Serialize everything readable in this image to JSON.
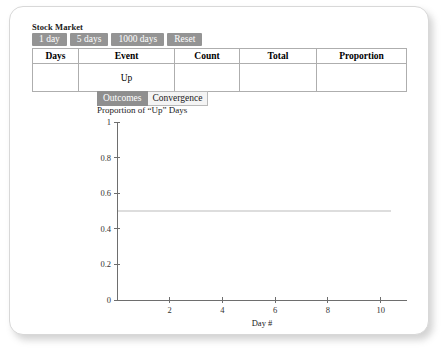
{
  "app": {
    "title": "Stock Market"
  },
  "toolbar": {
    "buttons": [
      {
        "label": "1 day",
        "name": "one-day-button"
      },
      {
        "label": "5 days",
        "name": "five-days-button"
      },
      {
        "label": "1000 days",
        "name": "thousand-days-button"
      },
      {
        "label": "Reset",
        "name": "reset-button"
      }
    ]
  },
  "table": {
    "headers": [
      "Days",
      "Event",
      "Count",
      "Total",
      "Proportion"
    ],
    "rows": [
      {
        "days": "",
        "event": "Up",
        "count": "",
        "total": "",
        "proportion": ""
      }
    ]
  },
  "tabs": [
    {
      "label": "Outcomes",
      "selected": true
    },
    {
      "label": "Convergence",
      "selected": false
    }
  ],
  "chart_data": {
    "type": "line",
    "title": "Proportion of “Up” Days",
    "xlabel": "Day #",
    "ylabel": "",
    "xlim": [
      0,
      11
    ],
    "ylim": [
      0,
      1
    ],
    "xticks": [
      "2",
      "4",
      "6",
      "8",
      "10"
    ],
    "xtick_values": [
      2,
      4,
      6,
      8,
      10
    ],
    "yticks": [
      "0",
      "0.2",
      "0.4",
      "0.6",
      "0.8",
      "1"
    ],
    "ytick_values": [
      0,
      0.2,
      0.4,
      0.6,
      0.8,
      1
    ],
    "grid": false,
    "legend": null,
    "series": [
      {
        "name": "Proportion of Up days",
        "x": [],
        "y": []
      }
    ],
    "reference_lines": [
      {
        "orientation": "horizontal",
        "value": 0.5,
        "color": "#dddddd",
        "x_end": 10.4
      }
    ]
  },
  "colors": {
    "button_fill": "#949494",
    "tab_selected": "#8f8f8f",
    "table_border": "#aeaeae",
    "reference_line": "#dddddd",
    "axis": "#6e6e6e"
  }
}
